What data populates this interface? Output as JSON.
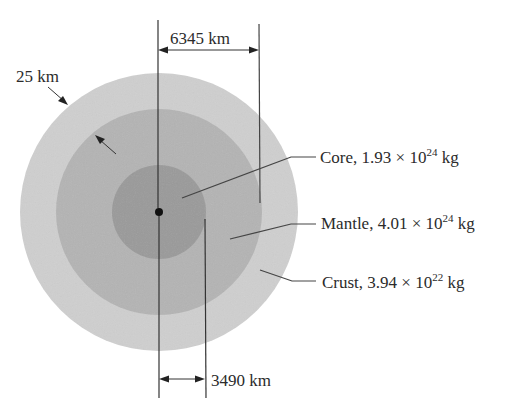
{
  "figure": {
    "layers": [
      {
        "name": "Core",
        "mass_mantissa": "1.93",
        "mass_exponent": "24",
        "unit": "kg",
        "color": "#9c9c9c"
      },
      {
        "name": "Mantle",
        "mass_mantissa": "4.01",
        "mass_exponent": "24",
        "unit": "kg",
        "color": "#b6b6b6"
      },
      {
        "name": "Crust",
        "mass_mantissa": "3.94",
        "mass_exponent": "22",
        "unit": "kg",
        "color": "#d0d0d0"
      }
    ],
    "labels": {
      "core_prefix": "Core, 1.93 × 10",
      "core_exp": "24",
      "core_unit": " kg",
      "mantle_prefix": "Mantle, 4.01 × 10",
      "mantle_exp": "24",
      "mantle_unit": " kg",
      "crust_prefix": "Crust, 3.94 × 10",
      "crust_exp": "22",
      "crust_unit": " kg"
    },
    "dimensions": {
      "mantle_radius": "6345 km",
      "core_radius": "3490 km",
      "crust_thickness": "25 km"
    }
  }
}
